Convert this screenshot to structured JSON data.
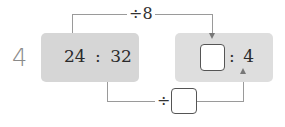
{
  "problem": {
    "number": "4",
    "left_ratio": {
      "first": "24",
      "separator": ":",
      "second": "32"
    },
    "right_ratio": {
      "first_blank": "",
      "separator": ":",
      "second": "4"
    },
    "top_operation": {
      "symbol": "÷",
      "value": "8"
    },
    "bottom_operation": {
      "symbol": "÷",
      "value_blank": ""
    }
  }
}
